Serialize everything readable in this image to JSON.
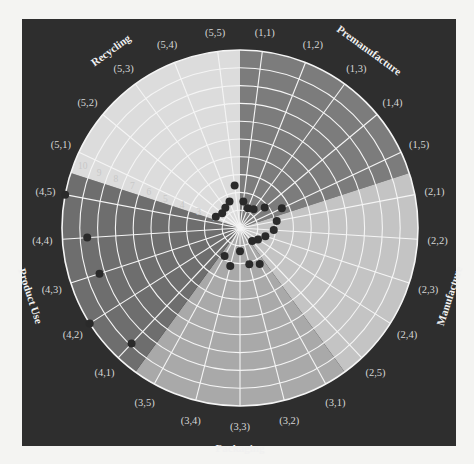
{
  "chart_data": {
    "type": "radar",
    "title": "",
    "center": [
      240,
      228
    ],
    "radius": 178,
    "rings": 10,
    "ring_labels": [
      "2",
      "3",
      "4",
      "5",
      "6",
      "7",
      "8",
      "9",
      "10"
    ],
    "categories": [
      {
        "name": "Premanufacture",
        "color": "#7c7c7c",
        "axes": [
          "(1,1)",
          "(1,2)",
          "(1,3)",
          "(1,4)",
          "(1,5)"
        ],
        "values": [
          1.5,
          1.2,
          1.3,
          1.8,
          2.6
        ]
      },
      {
        "name": "Manufacture",
        "color": "#c4c4c4",
        "axes": [
          "(2,1)",
          "(2,2)",
          "(2,3)",
          "(2,4)",
          "(2,5)"
        ],
        "values": [
          2.1,
          1.9,
          1.5,
          1.2,
          1.0
        ]
      },
      {
        "name": "Packaging",
        "color": "#a9a9a9",
        "axes": [
          "(3,1)",
          "(3,2)",
          "(3,3)",
          "(3,4)",
          "(3,5)"
        ],
        "values": [
          2.3,
          2.1,
          1.3,
          2.2,
          1.8
        ]
      },
      {
        "name": "Product Use",
        "color": "#6e6e6e",
        "axes": [
          "(4,1)",
          "(4,2)",
          "(4,3)",
          "(4,4)",
          "(4,5)"
        ],
        "values": [
          8.9,
          10.0,
          8.3,
          8.6,
          10.0
        ]
      },
      {
        "name": "Recycling",
        "color": "#dcdcdc",
        "axes": [
          "(5,1)",
          "(5,2)",
          "(5,3)",
          "(5,4)",
          "(5,5)"
        ],
        "values": [
          1.5,
          1.3,
          1.4,
          1.6,
          2.4
        ]
      }
    ],
    "grid": true,
    "legend": "none"
  }
}
